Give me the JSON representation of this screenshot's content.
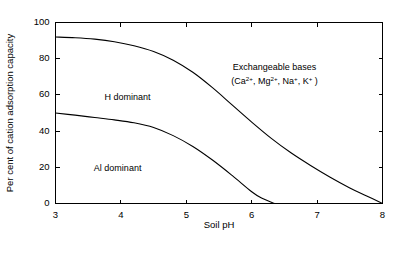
{
  "chart_data": {
    "type": "line",
    "title": "",
    "xlabel": "Soil pH",
    "ylabel": "Per cent of cation adsorption capacity",
    "xlim": [
      3,
      8
    ],
    "ylim": [
      0,
      100
    ],
    "xticks": [
      3,
      4,
      5,
      6,
      7,
      8
    ],
    "xtick_labels": [
      "3",
      "4",
      "5",
      "6",
      "7",
      "8"
    ],
    "yticks": [
      0,
      20,
      40,
      60,
      80,
      100
    ],
    "ytick_labels": [
      "0",
      "20",
      "40",
      "60",
      "80",
      "100"
    ],
    "grid": false,
    "legend": "none",
    "series": [
      {
        "name": "H dominant upper boundary",
        "x": [
          3.0,
          3.3,
          3.6,
          3.9,
          4.2,
          4.5,
          4.8,
          5.1,
          5.4,
          5.7,
          6.0,
          6.3,
          6.6,
          6.9,
          7.2,
          7.5,
          7.75,
          8.0
        ],
        "values": [
          92,
          91.6,
          90.8,
          89.4,
          87.2,
          84,
          79.2,
          72.5,
          64,
          54.5,
          45,
          36,
          28,
          21,
          14.5,
          8.6,
          4.3,
          0
        ]
      },
      {
        "name": "Al dominant upper boundary",
        "x": [
          3.0,
          3.3,
          3.6,
          3.9,
          4.2,
          4.5,
          4.8,
          5.1,
          5.4,
          5.7,
          6.0,
          6.15,
          6.35
        ],
        "values": [
          50,
          48.8,
          47.5,
          46.2,
          44.6,
          42,
          37.5,
          31.5,
          24,
          15.5,
          6.5,
          3.0,
          0
        ]
      }
    ],
    "annotations": [
      {
        "id": "h-dominant",
        "text": "H dominant",
        "x": 4.1,
        "y": 57
      },
      {
        "id": "al-dominant",
        "text": "Al dominant",
        "x": 3.95,
        "y": 18
      },
      {
        "id": "exchangeable-bases",
        "text": "Exchangeable bases",
        "x": 6.35,
        "y": 74
      }
    ],
    "formula": {
      "open_paren": "(",
      "ions": [
        {
          "element": "Ca",
          "charge": "2+"
        },
        {
          "element": "Mg",
          "charge": "2+"
        },
        {
          "element": "Na",
          "charge": "+"
        },
        {
          "element": "K",
          "charge": "+"
        }
      ],
      "separator": ", ",
      "close_paren": " )",
      "x": 6.35,
      "y": 66
    },
    "colors": {
      "curve": "#000000",
      "axis": "#000000",
      "background": "#ffffff"
    }
  }
}
